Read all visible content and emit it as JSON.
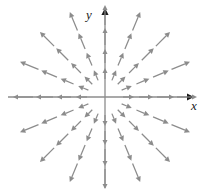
{
  "figure": {
    "kind": "vector-field-plot",
    "width": 207,
    "height": 196,
    "background": "#ffffff"
  },
  "axes": {
    "x_label": "x",
    "y_label": "y",
    "origin_px": {
      "x": 105,
      "y": 97
    },
    "color": "#8c8c8c",
    "arrowhead_color": "#1a1a1a",
    "x_axis": {
      "x_start_px": 8,
      "x_end_px": 190,
      "y_px": 97
    },
    "y_axis": {
      "y_start_px": 188,
      "y_end_px": 12,
      "x_px": 105
    }
  },
  "chart_data": {
    "type": "scatter",
    "title": "",
    "xlabel": "x",
    "ylabel": "y",
    "grid": false,
    "legend": null,
    "field_type": "radial-outward",
    "vector_color": "#8c8c8c",
    "ray_count": 16,
    "ray_angle_step_deg": 22.5,
    "ray_angles_deg": [
      0,
      22.5,
      45,
      67.5,
      90,
      112.5,
      135,
      157.5,
      180,
      202.5,
      225,
      247.5,
      270,
      292.5,
      315,
      337.5
    ],
    "radii_px": [
      18,
      34,
      52,
      72
    ],
    "arrow_len_px": [
      11,
      14,
      17,
      20
    ],
    "axis_radii_px": [
      18,
      34,
      52,
      72
    ],
    "note": "Every arrow points directly away from the origin; magnitude grows with distance from origin."
  }
}
